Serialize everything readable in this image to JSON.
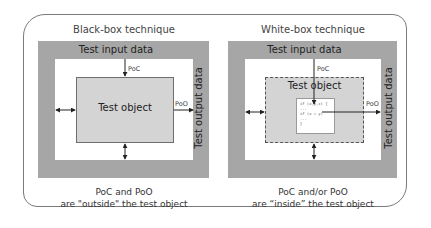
{
  "diagram": {
    "colors": {
      "frame_border": "#7a7a7a",
      "data_band": "#a6a6a6",
      "test_object_fill": "#d4d4d4",
      "arrow": "#222222"
    },
    "left_panel": {
      "title": "Black-box technique",
      "input_label": "Test input data",
      "output_label": "Test output data",
      "object_label": "Test object",
      "poc_label": "PoC",
      "poo_label": "PoO",
      "caption_line1": "PoC and PoO",
      "caption_line2": "are \"outside\" the test object"
    },
    "right_panel": {
      "title": "White-box technique",
      "input_label": "Test input data",
      "output_label": "Test output data",
      "object_label": "Test object",
      "poc_label": "PoC",
      "poo_label": "PoO",
      "code_lines": [
        "if (x,y,z) {",
        "...",
        "if (x = y)",
        "...",
        "}"
      ],
      "caption_line1": "PoC and/or PoO",
      "caption_line2": "are “inside” the test object"
    }
  }
}
